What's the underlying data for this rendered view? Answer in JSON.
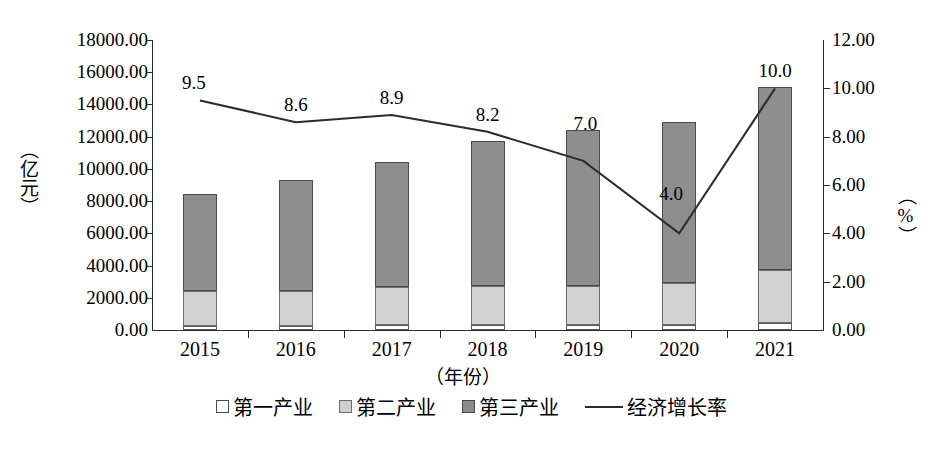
{
  "chart_data": {
    "type": "bar",
    "title": "",
    "subtitle": "",
    "xlabel": "（年份）",
    "ylabel": "（亿元）",
    "y2label": "（%）",
    "categories": [
      "2015",
      "2016",
      "2017",
      "2018",
      "2019",
      "2020",
      "2021"
    ],
    "ylim": [
      0,
      18000
    ],
    "y2lim": [
      0,
      12
    ],
    "yticks": [
      "0.00",
      "2000.00",
      "4000.00",
      "6000.00",
      "8000.00",
      "10000.00",
      "12000.00",
      "14000.00",
      "16000.00",
      "18000.00"
    ],
    "ytick_values": [
      0,
      2000,
      4000,
      6000,
      8000,
      10000,
      12000,
      14000,
      16000,
      18000
    ],
    "y2ticks": [
      "0.00",
      "2.00",
      "4.00",
      "6.00",
      "8.00",
      "10.00",
      "12.00"
    ],
    "y2tick_values": [
      0,
      2,
      4,
      6,
      8,
      10,
      12
    ],
    "grid": false,
    "legend_position": "bottom",
    "stacked": true,
    "series": [
      {
        "name": "第一产业",
        "type": "bar",
        "axis": "left",
        "color": "#ffffff",
        "values": [
          260,
          270,
          290,
          300,
          300,
          330,
          420
        ]
      },
      {
        "name": "第二产业",
        "type": "bar",
        "axis": "left",
        "color": "#d2d2d2",
        "values": [
          2190,
          2180,
          2360,
          2450,
          2450,
          2570,
          3330
        ]
      },
      {
        "name": "第三产业",
        "type": "bar",
        "axis": "left",
        "color": "#8e8e8e",
        "values": [
          6000,
          6850,
          7800,
          9000,
          9650,
          10000,
          11350
        ]
      },
      {
        "name": "经济增长率",
        "type": "line",
        "axis": "right",
        "color": "#2b2b2b",
        "values": [
          9.5,
          8.6,
          8.9,
          8.2,
          7.0,
          4.0,
          10.0
        ],
        "labels": [
          "9.5",
          "8.6",
          "8.9",
          "8.2",
          "7.0",
          "4.0",
          "10.0"
        ]
      }
    ],
    "bar_totals": [
      8450,
      9300,
      10450,
      11750,
      12400,
      12900,
      15100
    ]
  },
  "legend": {
    "items": [
      {
        "label": "第一产业",
        "marker": "square-white-swatch"
      },
      {
        "label": "第二产业",
        "marker": "square-light-gray-swatch"
      },
      {
        "label": "第三产业",
        "marker": "square-dark-gray-swatch"
      },
      {
        "label": "经济增长率",
        "marker": "line-swatch"
      }
    ]
  }
}
